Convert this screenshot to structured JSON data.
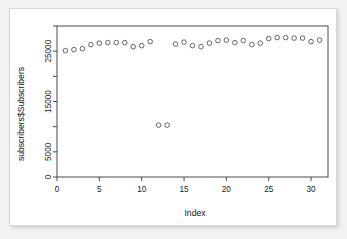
{
  "chart_data": {
    "type": "scatter",
    "title": "",
    "xlabel": "Index",
    "ylabel": "subscribers$Subscribers",
    "xlim": [
      0,
      32
    ],
    "ylim": [
      0,
      30000
    ],
    "grid": false,
    "legend": null,
    "xticks": [
      0,
      5,
      10,
      15,
      20,
      25,
      30
    ],
    "xtick_labels": [
      "0",
      "5",
      "10",
      "15",
      "20",
      "25",
      "30"
    ],
    "yticks": [
      0,
      5000,
      15000,
      25000
    ],
    "ytick_labels": [
      "0",
      "5000",
      "15000",
      "25000"
    ],
    "ytick_minor": [
      10000,
      20000,
      30000
    ],
    "marker": "open-circle",
    "marker_color": "#4c4c52",
    "x": [
      1,
      2,
      3,
      4,
      5,
      6,
      7,
      8,
      9,
      10,
      11,
      12,
      13,
      14,
      15,
      16,
      17,
      18,
      19,
      20,
      21,
      22,
      23,
      24,
      25,
      26,
      27,
      28,
      29,
      30,
      31
    ],
    "y": [
      25100,
      25300,
      25500,
      26300,
      26600,
      26700,
      26700,
      26700,
      25900,
      26100,
      26900,
      10300,
      10300,
      26400,
      26800,
      26100,
      25900,
      26600,
      27100,
      27200,
      26700,
      27100,
      26300,
      26600,
      27500,
      27700,
      27700,
      27600,
      27600,
      26900,
      27200
    ],
    "annotations": []
  },
  "axis_titles": {
    "x": "Index",
    "y": "subscribers$Subscribers"
  },
  "colors": {
    "marker": "#4c4c52",
    "axis": "#4a4a4a",
    "text": "#111111",
    "card_bg": "#ffffff",
    "page_bg": "#f2f2f2",
    "card_border": "#d8d8d8"
  }
}
